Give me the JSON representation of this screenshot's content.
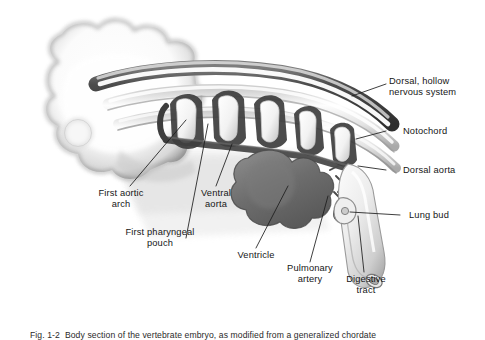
{
  "figure": {
    "kind": "anatomical-illustration",
    "background_color": "#ffffff",
    "ink_color": "#161616",
    "tone_mid": "#9a9a9a",
    "tone_dark": "#4a4a4a",
    "tone_light": "#e6e6e6"
  },
  "labels": {
    "dorsal_nervous_system": "Dorsal, hollow\nnervous system",
    "notochord": "Notochord",
    "dorsal_aorta": "Dorsal aorta",
    "lung_bud": "Lung bud",
    "digestive_tract": "Digestive\ntract",
    "pulmonary_artery": "Pulmonary\nartery",
    "ventricle": "Ventricle",
    "ventral_aorta": "Ventral\naorta",
    "first_pharyngeal_pouch": "First pharyngeal\npouch",
    "first_aortic_arch": "First aortic\narch"
  },
  "caption": {
    "text": "Fig. 1-2  Body section of the vertebrate embryo, as modified from a generalized chordate"
  }
}
